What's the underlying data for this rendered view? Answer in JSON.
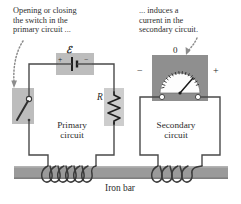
{
  "figure": {
    "background_color": "#ffffff"
  },
  "captions": {
    "primary": "Opening or closing\nthe switch in the\nprimary circuit ...",
    "secondary": "... induces a\ncurrent in the\nsecondary circuit."
  },
  "labels": {
    "primary_circuit": "Primary\ncircuit",
    "secondary_circuit": "Secondary\ncircuit",
    "iron_bar": "Iron bar",
    "emf_symbol": "ℰ",
    "resistor_symbol": "R",
    "battery_plus": "+",
    "battery_minus": "−",
    "meter_zero": "0",
    "meter_minus": "−",
    "meter_plus": "+"
  },
  "components": {
    "switch": {
      "name": "open-knife-switch",
      "state": "open",
      "highlight_color": "#bdbdbd"
    },
    "battery": {
      "name": "battery-emf-source",
      "highlight_color": "#bdbdbd",
      "terminals": [
        "+",
        "−"
      ]
    },
    "resistor": {
      "name": "resistor",
      "highlight_color": "#c9c9c9",
      "zigzag_segments": 7
    },
    "galvanometer": {
      "name": "galvanometer",
      "body_color": "#8f8f8f",
      "face_color": "#fdfdfd",
      "needle_deflection": "right-of-center",
      "tick_count": 15,
      "terminal_count": 2
    },
    "iron_bar": {
      "name": "iron-bar",
      "color": "#9a9a9a"
    },
    "primary_coil": {
      "name": "primary-coil",
      "turns": 6
    },
    "secondary_coil": {
      "name": "secondary-coil",
      "turns": 4
    }
  },
  "colors": {
    "wire": "#4a4a4a",
    "bar_gray": "#9a9a9a",
    "bar_gray_dark": "#7f7f7f",
    "highlight_gray": "#bdbdbd",
    "meter_gray": "#8f8f8f",
    "arrow_gray": "#8c8c8c",
    "text": "#2b2b2b"
  },
  "annotations": {
    "arrow_to_switch": "dotted-arrow-pointing-to-switch",
    "arrow_to_meter": "dotted-arrow-pointing-to-galvanometer"
  }
}
